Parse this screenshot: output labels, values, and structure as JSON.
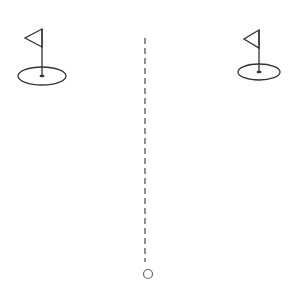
{
  "game": {
    "canvas": {
      "width": 304,
      "height": 289,
      "background": "#ffffff"
    },
    "stroke_color": "#333333",
    "holes": [
      {
        "id": "left-hole",
        "pole_x": 42,
        "pole_top": 29,
        "pole_bottom": 76,
        "flag_tip_x": 25,
        "flag_tip_y": 38,
        "flag_bottom_y": 47,
        "green_cx": 42,
        "green_cy": 76,
        "green_rx": 24,
        "green_ry": 9
      },
      {
        "id": "right-hole",
        "pole_x": 259,
        "pole_top": 30,
        "pole_bottom": 72,
        "flag_tip_x": 244,
        "flag_tip_y": 39,
        "flag_bottom_y": 48,
        "green_cx": 259,
        "green_cy": 72,
        "green_rx": 21,
        "green_ry": 8
      }
    ],
    "aim_line": {
      "x": 145,
      "y_start": 38,
      "y_end": 262,
      "dash": "6,4"
    },
    "ball": {
      "cx": 148,
      "cy": 274,
      "r": 4.5
    }
  }
}
